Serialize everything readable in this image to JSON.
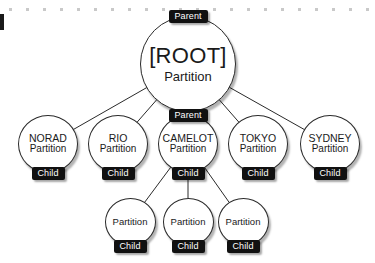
{
  "canvas": {
    "width": 375,
    "height": 263,
    "background": "#ffffff",
    "stroke_color": "#2a2a2a",
    "badge_color": "#111111",
    "badge_text_color": "#ffffff",
    "ruler_tick_color": "#c9c9c9"
  },
  "labels": {
    "parent_badge": "Parent",
    "child_badge": "Child",
    "partition": "Partition"
  },
  "diagram": {
    "type": "tree",
    "title": "",
    "nodes": [
      {
        "id": "root",
        "name": "[ROOT]",
        "sub": "Partition",
        "top_badge": "Parent",
        "bottom_badge": "",
        "row": "root",
        "cx": 188,
        "cy": 64,
        "r": 48
      },
      {
        "id": "norad",
        "name": "NORAD",
        "sub": "Partition",
        "top_badge": "",
        "bottom_badge": "Child",
        "row": "mid",
        "cx": 48,
        "cy": 144,
        "r": 30
      },
      {
        "id": "rio",
        "name": "RIO",
        "sub": "Partition",
        "top_badge": "",
        "bottom_badge": "Child",
        "row": "mid",
        "cx": 118,
        "cy": 144,
        "r": 30
      },
      {
        "id": "camelot",
        "name": "CAMELOT",
        "sub": "Partition",
        "top_badge": "Parent",
        "bottom_badge": "Child",
        "row": "mid",
        "cx": 188,
        "cy": 144,
        "r": 30
      },
      {
        "id": "tokyo",
        "name": "TOKYO",
        "sub": "Partition",
        "top_badge": "",
        "bottom_badge": "Child",
        "row": "mid",
        "cx": 258,
        "cy": 144,
        "r": 30
      },
      {
        "id": "sydney",
        "name": "SYDNEY",
        "sub": "Partition",
        "top_badge": "",
        "bottom_badge": "Child",
        "row": "mid",
        "cx": 330,
        "cy": 144,
        "r": 30
      },
      {
        "id": "leaf1",
        "name": "",
        "sub": "Partition",
        "top_badge": "",
        "bottom_badge": "Child",
        "row": "leaf",
        "cx": 130,
        "cy": 222,
        "r": 25
      },
      {
        "id": "leaf2",
        "name": "",
        "sub": "Partition",
        "top_badge": "",
        "bottom_badge": "Child",
        "row": "leaf",
        "cx": 188,
        "cy": 222,
        "r": 25
      },
      {
        "id": "leaf3",
        "name": "",
        "sub": "Partition",
        "top_badge": "",
        "bottom_badge": "Child",
        "row": "leaf",
        "cx": 243,
        "cy": 222,
        "r": 25
      }
    ],
    "edges": [
      {
        "from": "root",
        "to": "norad"
      },
      {
        "from": "root",
        "to": "rio"
      },
      {
        "from": "root",
        "to": "camelot"
      },
      {
        "from": "root",
        "to": "tokyo"
      },
      {
        "from": "root",
        "to": "sydney"
      },
      {
        "from": "camelot",
        "to": "leaf1"
      },
      {
        "from": "camelot",
        "to": "leaf2"
      },
      {
        "from": "camelot",
        "to": "leaf3"
      }
    ]
  },
  "ruler": {
    "tick_count": 22,
    "tick_spacing": 17,
    "tick_start_x": 9,
    "tick_y": 8
  }
}
